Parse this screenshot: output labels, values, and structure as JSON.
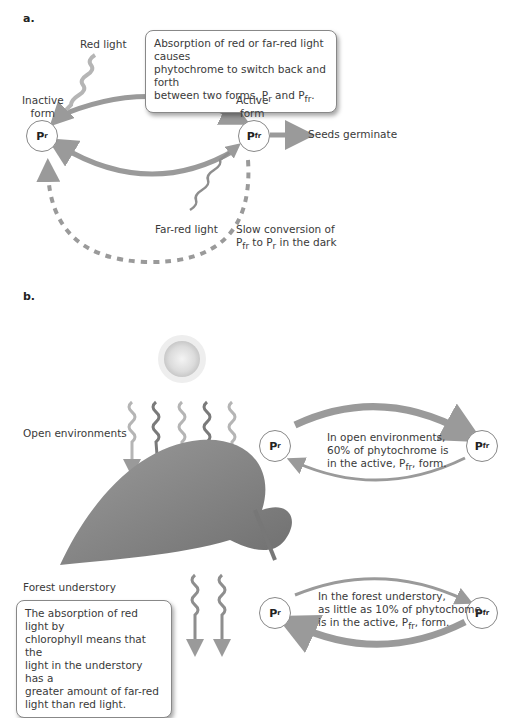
{
  "panel_a": {
    "label": "a.",
    "callout_line1": "Absorption of red or far-red light causes",
    "callout_line2": "phytochrome to switch back and forth",
    "callout_line3_prefix": "between two forms, P",
    "callout_line3_sub1": "r",
    "callout_line3_mid": " and P",
    "callout_line3_sub2": "fr",
    "callout_line3_suffix": ".",
    "red_light_label": "Red light",
    "inactive_label_1": "Inactive",
    "inactive_label_2": "form",
    "active_label_1": "Active",
    "active_label_2": "form",
    "node_pr": {
      "base": "P",
      "sub": "r"
    },
    "node_pfr": {
      "base": "P",
      "sub": "fr"
    },
    "seeds_label": "Seeds germinate",
    "far_red_label": "Far-red light",
    "slow_line1": "Slow conversion of",
    "slow_line2_p1": "P",
    "slow_line2_sub1": "fr",
    "slow_line2_mid": " to P",
    "slow_line2_sub2": "r",
    "slow_line2_suffix": " in the dark"
  },
  "panel_b": {
    "label": "b.",
    "open_env_label": "Open environments",
    "forest_label": "Forest understory",
    "forest_callout": [
      "The absorption of red light by",
      "chlorophyll means that the",
      "light in the understory has a",
      "greater amount of far-red",
      "light than red light."
    ],
    "open_cycle": {
      "node_pr": {
        "base": "P",
        "sub": "r"
      },
      "node_pfr": {
        "base": "P",
        "sub": "fr"
      },
      "line1": "In open environments,",
      "line2": "60% of phytochrome is",
      "line3_prefix": "in the active, P",
      "line3_sub": "fr",
      "line3_suffix": ", form.",
      "active_percent": 60
    },
    "forest_cycle": {
      "node_pr": {
        "base": "P",
        "sub": "r"
      },
      "node_pfr": {
        "base": "P",
        "sub": "fr"
      },
      "line1": "In the forest understory,",
      "line2": "as little as 10% of phytochome",
      "line3_prefix": "is in the active, P",
      "line3_sub": "fr",
      "line3_suffix": ", form.",
      "active_percent": 10
    }
  },
  "colors": {
    "arrow_gray": "#9a9a9a",
    "leaf": "#8a8a8a",
    "sun": "#e0e0e0"
  }
}
